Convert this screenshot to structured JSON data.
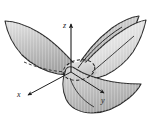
{
  "figure": {
    "name": "hyperbolic-paraboloid-saddle-surface",
    "title": "",
    "background_color": "#ffffff",
    "outline_color": "#2b2b2b",
    "surface_fill_light": "#ececec",
    "surface_fill_mid": "#c9c9c9",
    "surface_fill_dark": "#a8a8a8",
    "hidden_line_style": "dashed",
    "axes": [
      {
        "id": "x",
        "label": "x",
        "label_x": 20,
        "label_y": 95,
        "direction": "down-left-front"
      },
      {
        "id": "y",
        "label": "y",
        "label_x": 104,
        "label_y": 100,
        "direction": "down-right-front"
      },
      {
        "id": "z",
        "label": "z",
        "label_x": 65,
        "label_y": 25,
        "direction": "up"
      }
    ],
    "features": [
      {
        "name": "saddle-point-ellipse",
        "style": "dashed",
        "cx": 78,
        "cy": 70
      },
      {
        "name": "left-wing",
        "shading": "gradient-gray"
      },
      {
        "name": "right-upper-wing",
        "shading": "gradient-light-gray"
      },
      {
        "name": "front-lower-lobe",
        "shading": "gradient-gray"
      },
      {
        "name": "back-upper-lobe",
        "shading": "gradient-gray"
      }
    ]
  }
}
